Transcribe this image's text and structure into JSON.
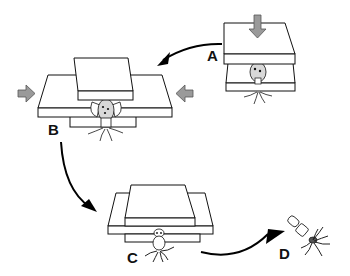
{
  "figure": {
    "panels": [
      {
        "id": "A",
        "label": "A",
        "caption": "Top plate pressed down onto specimen between two plates"
      },
      {
        "id": "B",
        "label": "B",
        "caption": "Plates pushed laterally from both sides (shear)"
      },
      {
        "id": "C",
        "label": "C",
        "caption": "Plates offset; specimen protruding below"
      },
      {
        "id": "D",
        "label": "D",
        "caption": "Released elongated specimen with tentacles"
      }
    ],
    "colors": {
      "line": "#111111",
      "plate_fill": "#ffffff",
      "push_arrow_fill": "#9a9a9a",
      "flow_arrow": "#000000",
      "specimen_fill": "#d8d8d8"
    }
  }
}
